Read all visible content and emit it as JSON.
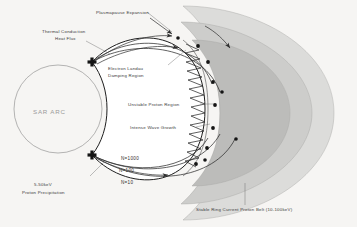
{
  "figure": {
    "background_color": "#f6f5f3"
  },
  "colors": {
    "shell_outer": "#dcdcda",
    "shell_mid": "#cdcdcb",
    "shell_inner": "#bcbcba",
    "line": "#2e2e2e",
    "label": "#3a3a3a",
    "sar_label": "#9a9a9a"
  },
  "labels": {
    "plasmapause_expansion": "Plasmapause Expansion",
    "thermal_conduction_line1": "Thermal Conduction",
    "thermal_conduction_line2": "Heat Flux",
    "electron_landau_line1": "Electron Landau",
    "electron_landau_line2": "Damping Region",
    "unstable_proton_region": "Unstable Proton Region",
    "intense_wave_growth": "Intense Wave Growth",
    "sar_arc": "SAR ARC",
    "proton_precipitation_line1": "5-50keV",
    "proton_precipitation_line2": "Proton Precipitation",
    "stable_ring_current": "Stable Ring Current Proton Belt (10-100keV)"
  },
  "contours": [
    {
      "name": "N=1000",
      "label": "N=1000"
    },
    {
      "name": "N=100",
      "label": "N=100"
    },
    {
      "name": "N=10",
      "label": "N=10"
    }
  ],
  "icons": {
    "arrowhead": "arrowhead-icon",
    "node_point": "node-point-icon",
    "wave": "wave-zigzag-icon"
  }
}
